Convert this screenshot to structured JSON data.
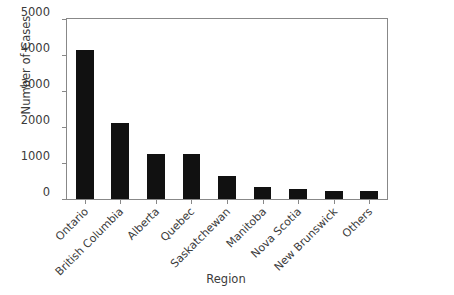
{
  "chart_data": {
    "type": "bar",
    "title": "",
    "xlabel": "Region",
    "ylabel": "Number of Cases",
    "categories": [
      "Ontario",
      "British Columbia",
      "Alberta",
      "Quebec",
      "Saskatchewan",
      "Manitoba",
      "Nova Scotia",
      "New Brunswick",
      "Others"
    ],
    "values": [
      4150,
      2100,
      1250,
      1250,
      640,
      320,
      290,
      230,
      215
    ],
    "ylim": [
      0,
      5000
    ],
    "yticks": [
      0,
      1000,
      2000,
      3000,
      4000,
      5000
    ],
    "ytick_labels": [
      "0",
      "1000",
      "2000",
      "3000",
      "4000",
      "5000"
    ],
    "grid": false,
    "legend": null,
    "bar_color": "#111111",
    "axis_color": "#888888",
    "text_color": "#3b3b3b"
  }
}
